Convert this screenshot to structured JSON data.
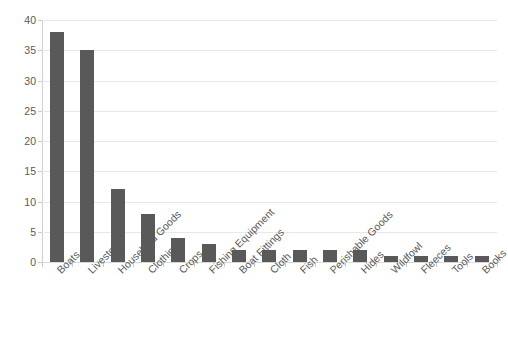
{
  "chart_data": {
    "type": "bar",
    "title": "",
    "xlabel": "",
    "ylabel": "",
    "categories": [
      "Boats",
      "Livestock",
      "Household Goods",
      "Clothing",
      "Crops",
      "Fishing Equipment",
      "Boat Fittings",
      "Cloth",
      "Fish",
      "Perishable Goods",
      "Hides",
      "Wildfowl",
      "Fleeces",
      "Tools",
      "Books"
    ],
    "values": [
      38,
      35,
      12,
      8,
      4,
      3,
      2,
      2,
      2,
      2,
      2,
      1,
      1,
      1,
      1
    ],
    "ylim": [
      0,
      40
    ],
    "ytick_labels": [
      "0",
      "5",
      "10",
      "15",
      "20",
      "25",
      "30",
      "35",
      "40"
    ],
    "ytick_values": [
      0,
      5,
      10,
      15,
      20,
      25,
      30,
      35,
      40
    ],
    "grid": true,
    "grid_axis": "y",
    "legend": false,
    "legend_position": "none",
    "bar_color": "#595959",
    "gridline_color": "#e8e8e8",
    "axis_color": "#c8c8c8",
    "tick_label_color": "#5a5a5a",
    "background_color": "#ffffff",
    "category_label_rotation": -45
  }
}
